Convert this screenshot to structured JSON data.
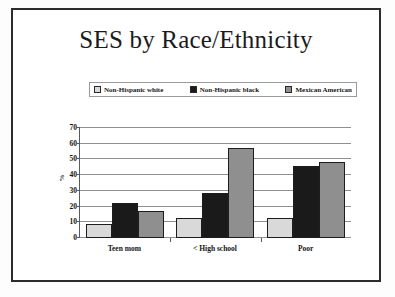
{
  "slide": {
    "title": "SES by Race/Ethnicity"
  },
  "chart_data": {
    "type": "bar",
    "title": "SES by Race/Ethnicity",
    "xlabel": "",
    "ylabel": "%",
    "ylim": [
      0,
      70
    ],
    "yticks": [
      0,
      10,
      20,
      30,
      40,
      50,
      60,
      70
    ],
    "grid": true,
    "legend_position": "top",
    "categories": [
      "Teen mom",
      "< High school",
      "Poor"
    ],
    "series": [
      {
        "name": "Non-Hispanic white",
        "color": "#d9d9d9",
        "values": [
          9,
          13,
          12.5
        ]
      },
      {
        "name": "Non-Hispanic black",
        "color": "#1a1a1a",
        "values": [
          22,
          28.5,
          46
        ]
      },
      {
        "name": "Mexican American",
        "color": "#8f8f8f",
        "values": [
          17.5,
          57,
          48.5
        ]
      }
    ]
  }
}
